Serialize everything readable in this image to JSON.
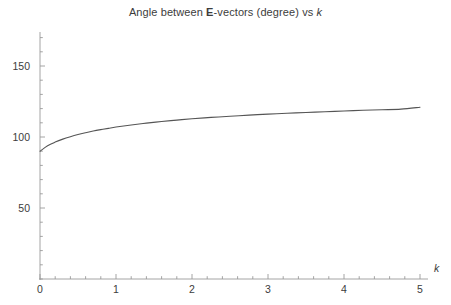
{
  "figure": {
    "background": "#ffffff",
    "title_parts": {
      "pre": "Angle between ",
      "bold": "E",
      "mid": "-vectors (degree) vs ",
      "italic": "k"
    },
    "title_text": "Angle between E-vectors (degree) vs k"
  },
  "style": {
    "curve_color": "#555555",
    "axis_color": "#9a9a9a",
    "text_color": "#3c3c3c",
    "curve_width": 1.1,
    "axis_width": 0.9
  },
  "chart_data": {
    "type": "line",
    "title": "Angle between E-vectors (degree) vs k",
    "xlabel": "k",
    "ylabel": "",
    "xlim": [
      0,
      5
    ],
    "ylim": [
      0,
      175
    ],
    "grid": false,
    "legend": null,
    "x_ticks_major": [
      0,
      1,
      2,
      3,
      4,
      5
    ],
    "x_tick_labels": [
      "0",
      "1",
      "2",
      "3",
      "4",
      "5"
    ],
    "x_minor_step": 0.2,
    "y_ticks_major": [
      50,
      100,
      150
    ],
    "y_tick_labels": [
      "50",
      "100",
      "150"
    ],
    "y_minor_step": 10,
    "series": [
      {
        "name": "angle",
        "x": [
          0.0,
          0.1,
          0.2,
          0.3,
          0.4,
          0.5,
          0.6,
          0.7,
          0.8,
          0.9,
          1.0,
          1.2,
          1.4,
          1.6,
          1.8,
          2.0,
          2.25,
          2.5,
          2.75,
          3.0,
          3.25,
          3.5,
          3.75,
          4.0,
          4.25,
          4.5,
          4.75,
          5.0
        ],
        "y": [
          90.0,
          93.8,
          96.4,
          98.5,
          100.2,
          101.7,
          103.0,
          104.2,
          105.2,
          106.1,
          107.0,
          108.5,
          109.8,
          110.9,
          111.9,
          112.8,
          113.8,
          114.6,
          115.4,
          116.1,
          116.7,
          117.3,
          117.8,
          118.3,
          118.8,
          119.2,
          119.6,
          121.0
        ]
      }
    ],
    "annotations": []
  },
  "axes_geometry": {
    "x_pixel_at_0": 40,
    "x_pixel_at_5": 420,
    "y_pixel_at_0": 279,
    "y_pixel_at_150": 66,
    "y_axis_top_pixel": 32,
    "x_axis_right_pixel": 428
  }
}
